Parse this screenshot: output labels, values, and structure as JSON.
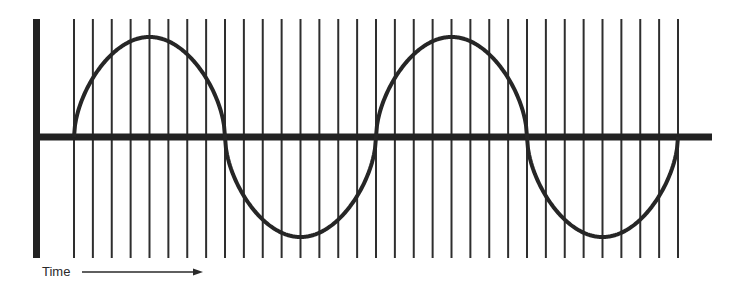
{
  "diagram": {
    "axis_label_x": "Time",
    "colors": {
      "background": "#ffffff",
      "axis": "#222222",
      "grid": "#2e2e2e",
      "curve": "#262626",
      "label": "#2a2a2a"
    },
    "geometry": {
      "vertical_axis": {
        "x": 36.5,
        "y1": 19,
        "y2": 258,
        "width": 7
      },
      "horizontal_axis": {
        "x1": 33,
        "x2": 712,
        "y": 137,
        "width": 7
      },
      "sample_lines": {
        "count": 33,
        "x_start": 74,
        "x_end": 678,
        "y1": 19,
        "y2": 258,
        "width": 2
      },
      "wave": {
        "x_start": 74,
        "x_end": 678,
        "baseline_y": 137,
        "amplitude": 100,
        "cycles": 2,
        "shape_exponent": 0.55,
        "stroke_width": 4
      },
      "time_arrow": {
        "x1": 82,
        "x2": 203,
        "y": 272
      }
    }
  },
  "chart_data": {
    "type": "line",
    "title": "",
    "xlabel": "Time",
    "ylabel": "",
    "cycles": 2,
    "sample_count": 33,
    "x": [
      0,
      1,
      2,
      3,
      4,
      5,
      6,
      7,
      8,
      9,
      10,
      11,
      12,
      13,
      14,
      15,
      16,
      17,
      18,
      19,
      20,
      21,
      22,
      23,
      24,
      25,
      26,
      27,
      28,
      29,
      30,
      31,
      32
    ],
    "values_normalized": [
      0,
      0.67,
      0.89,
      0.97,
      1,
      0.97,
      0.89,
      0.67,
      0,
      -0.67,
      -0.89,
      -0.97,
      -1,
      -0.97,
      -0.89,
      -0.67,
      0,
      0.67,
      0.89,
      0.97,
      1,
      0.97,
      0.89,
      0.67,
      0,
      -0.67,
      -0.89,
      -0.97,
      -1,
      -0.97,
      -0.89,
      -0.67,
      0
    ],
    "grid": true,
    "legend": null
  }
}
